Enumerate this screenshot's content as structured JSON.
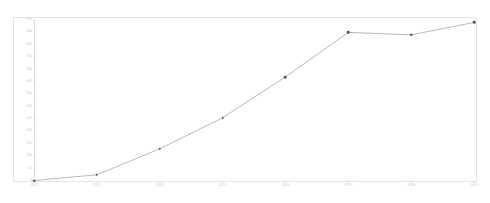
{
  "chart_data": {
    "type": "line",
    "title": "",
    "xlabel": "",
    "ylabel": "",
    "categories": [
      "2012",
      "2013",
      "2014",
      "2015",
      "2016",
      "2017",
      "2018",
      "2019"
    ],
    "values": [
      2,
      25,
      130,
      255,
      420,
      600,
      590,
      640
    ],
    "series": [
      {
        "name": "",
        "values": [
          2,
          25,
          130,
          255,
          420,
          600,
          590,
          640
        ]
      }
    ],
    "ylim": [
      0,
      650
    ],
    "xlim_categories": 8,
    "y_ticks": [
      0,
      50,
      100,
      150,
      200,
      250,
      300,
      350,
      400,
      450,
      500,
      550,
      600,
      650
    ],
    "y_tick_labels": [
      "0",
      "50",
      "100",
      "150",
      "200",
      "250",
      "300",
      "350",
      "400",
      "450",
      "500",
      "550",
      "600",
      "650"
    ],
    "grid": false,
    "legend": "none",
    "marker": "circle",
    "line_color": "#9a9aa4",
    "marker_color": "#55555f",
    "frame_color": "#e3e3e8",
    "tick_label_color": "#c7c7ce",
    "background_color": "#ffffff"
  }
}
